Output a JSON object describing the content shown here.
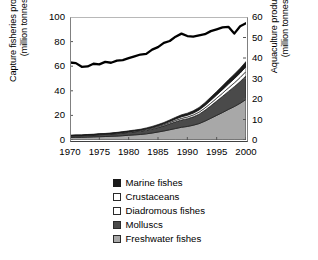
{
  "chart_data": {
    "type": "area",
    "title": "",
    "subtitle": "",
    "xlabel": "",
    "ylabel": "Capture fisheries production\n(million tonnes)",
    "y2label": "Aquaculture production\n(million tonnes)",
    "grid": false,
    "legend_position": "bottom",
    "xlim": [
      1970,
      2000
    ],
    "ylim": [
      0,
      100
    ],
    "y2lim": [
      0,
      60
    ],
    "xticks": [
      1970,
      1975,
      1980,
      1985,
      1990,
      1995,
      2000
    ],
    "xtick_labels": [
      "1970",
      "1975",
      "1980",
      "1985",
      "1990",
      "1995",
      "2000"
    ],
    "yticks": [
      0,
      20,
      40,
      60,
      80,
      100
    ],
    "ytick_labels": [
      "0",
      "20",
      "40",
      "60",
      "80",
      "100"
    ],
    "y2ticks": [
      0,
      10,
      20,
      30,
      40,
      50,
      60
    ],
    "y2tick_labels": [
      "0",
      "10",
      "20",
      "30",
      "40",
      "50",
      "60"
    ],
    "x": [
      1970,
      1971,
      1972,
      1973,
      1974,
      1975,
      1976,
      1977,
      1978,
      1979,
      1980,
      1981,
      1982,
      1983,
      1984,
      1985,
      1986,
      1987,
      1988,
      1989,
      1990,
      1991,
      1992,
      1993,
      1994,
      1995,
      1996,
      1997,
      1998,
      1999,
      2000
    ],
    "series": [
      {
        "name": "Freshwater fishes",
        "axis": "y2",
        "color": "#a8a8a8",
        "values": [
          1.2,
          1.3,
          1.3,
          1.4,
          1.5,
          1.6,
          1.7,
          1.8,
          1.9,
          2.1,
          2.3,
          2.5,
          2.7,
          3.0,
          3.4,
          3.9,
          4.4,
          5.0,
          5.6,
          6.2,
          6.6,
          7.2,
          8.0,
          9.2,
          10.6,
          12.0,
          13.4,
          14.9,
          16.3,
          17.9,
          19.8
        ]
      },
      {
        "name": "Molluscs",
        "axis": "y2",
        "color": "#4a4a4a",
        "values": [
          0.8,
          0.8,
          0.8,
          0.9,
          0.9,
          1.0,
          1.0,
          1.1,
          1.2,
          1.3,
          1.4,
          1.5,
          1.6,
          1.8,
          2.0,
          2.2,
          2.5,
          2.9,
          3.3,
          3.6,
          3.8,
          4.1,
          4.6,
          5.3,
          6.1,
          7.0,
          7.9,
          8.8,
          9.7,
          10.6,
          11.5
        ]
      },
      {
        "name": "Diadromous fishes",
        "axis": "y2",
        "color": "#ffffff",
        "values": [
          0.15,
          0.15,
          0.16,
          0.17,
          0.18,
          0.19,
          0.2,
          0.22,
          0.24,
          0.26,
          0.28,
          0.31,
          0.34,
          0.38,
          0.42,
          0.47,
          0.53,
          0.6,
          0.68,
          0.76,
          0.82,
          0.9,
          1.0,
          1.12,
          1.26,
          1.4,
          1.55,
          1.7,
          1.85,
          2.0,
          2.15
        ]
      },
      {
        "name": "Crustaceans",
        "axis": "y2",
        "color": "#ffffff",
        "values": [
          0.05,
          0.06,
          0.06,
          0.07,
          0.08,
          0.09,
          0.1,
          0.11,
          0.13,
          0.15,
          0.17,
          0.2,
          0.23,
          0.27,
          0.32,
          0.38,
          0.45,
          0.55,
          0.66,
          0.78,
          0.85,
          0.92,
          1.05,
          1.2,
          1.38,
          1.55,
          1.72,
          1.88,
          2.02,
          2.15,
          2.3
        ]
      },
      {
        "name": "Marine fishes",
        "axis": "y2",
        "color": "#1a1a1a",
        "values": [
          0.12,
          0.13,
          0.14,
          0.15,
          0.17,
          0.18,
          0.2,
          0.22,
          0.25,
          0.28,
          0.31,
          0.35,
          0.39,
          0.44,
          0.5,
          0.57,
          0.65,
          0.74,
          0.84,
          0.95,
          1.02,
          1.12,
          1.25,
          1.4,
          1.58,
          1.75,
          1.92,
          2.08,
          2.22,
          2.35,
          2.5
        ]
      }
    ],
    "line_series": {
      "name": "Capture fisheries production",
      "axis": "y",
      "color": "#000000",
      "values": [
        63.0,
        62.5,
        59.5,
        59.8,
        62.0,
        61.5,
        63.5,
        62.8,
        64.5,
        65.0,
        66.5,
        68.0,
        69.5,
        70.0,
        73.5,
        75.5,
        79.0,
        80.5,
        84.0,
        86.5,
        84.5,
        84.0,
        85.0,
        86.0,
        88.5,
        90.0,
        91.5,
        92.0,
        86.5,
        92.5,
        95.0
      ]
    }
  },
  "legend": {
    "items": [
      {
        "label": "Marine fishes",
        "swatch": "#1a1a1a",
        "border": "#1a1a1a"
      },
      {
        "label": "Crustaceans",
        "swatch": "#ffffff",
        "border": "#2a2a2a"
      },
      {
        "label": "Diadromous fishes",
        "swatch": "#ffffff",
        "border": "#2a2a2a"
      },
      {
        "label": "Molluscs",
        "swatch": "#4a4a4a",
        "border": "#2a2a2a"
      },
      {
        "label": "Freshwater fishes",
        "swatch": "#a8a8a8",
        "border": "#2a2a2a"
      }
    ]
  }
}
